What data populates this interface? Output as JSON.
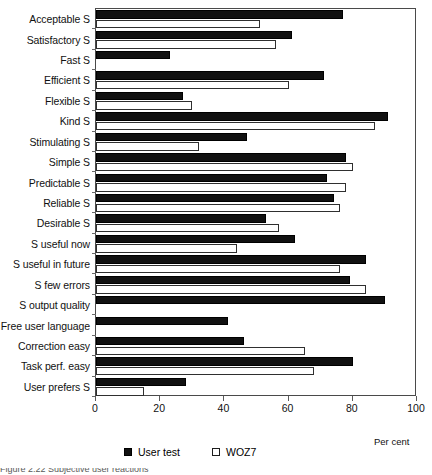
{
  "figure": {
    "axis_title": "Per cent",
    "caption": "Figure 2.22 Subjective user reactions"
  },
  "legend": {
    "position": "bottom-center",
    "items": [
      {
        "label": "User test",
        "swatch": "filled-square-icon",
        "color": "#111111"
      },
      {
        "label": "WOZ7",
        "swatch": "hollow-square-icon",
        "color": "#ffffff"
      }
    ]
  },
  "chart_data": {
    "type": "bar",
    "orientation": "horizontal",
    "title": "",
    "xlabel": "Per cent",
    "ylabel": "",
    "xlim": [
      0,
      100
    ],
    "xticks": [
      0,
      20,
      40,
      60,
      80,
      100
    ],
    "grid": false,
    "legend_position": "bottom-center",
    "categories": [
      "Acceptable S",
      "Satisfactory S",
      "Fast S",
      "Efficient S",
      "Flexible S",
      "Kind S",
      "Stimulating S",
      "Simple S",
      "Predictable S",
      "Reliable S",
      "Desirable S",
      "S useful now",
      "S useful in future",
      "S few errors",
      "S output quality",
      "Free user language",
      "Correction easy",
      "Task perf. easy",
      "User prefers S"
    ],
    "series": [
      {
        "name": "User test",
        "color": "#111111",
        "values": [
          77,
          61,
          23,
          71,
          27,
          91,
          47,
          78,
          72,
          74,
          53,
          62,
          84,
          79,
          90,
          41,
          46,
          80,
          28
        ]
      },
      {
        "name": "WOZ7",
        "color": "#ffffff",
        "values": [
          51,
          56,
          null,
          60,
          30,
          87,
          32,
          80,
          78,
          76,
          57,
          44,
          76,
          84,
          null,
          null,
          65,
          68,
          15
        ]
      }
    ]
  }
}
